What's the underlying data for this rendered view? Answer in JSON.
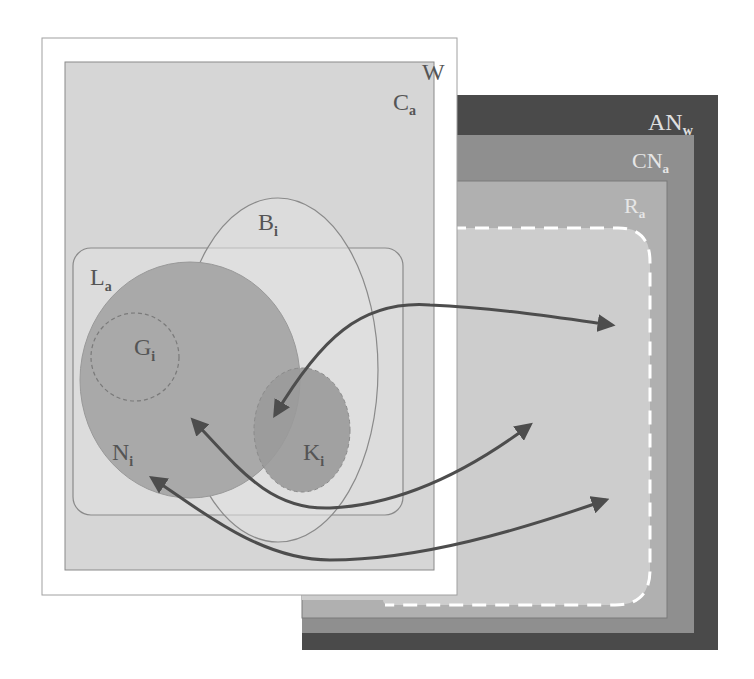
{
  "diagram": {
    "type": "nested-set-diagram",
    "colors": {
      "background": "#ffffff",
      "an_w_fill": "#4a4a4a",
      "cn_a_fill": "#8f8f8f",
      "r_a_fill": "#b0b0b0",
      "dashed_region_fill": "#cdcdcd",
      "dashed_region_stroke": "#ffffff",
      "w_fill": "#ffffff",
      "c_a_fill": "#d6d6d6",
      "l_a_fill": "#dcdcdc",
      "b_i_fill": "#e0e0e0",
      "n_i_fill": "#a9a9a9",
      "k_i_fill": "#9a9a9a",
      "arrow": "#4d4d4d",
      "outline": "#8a8a8a",
      "light_label": "#e6e6e6",
      "dark_label": "#555555"
    },
    "labels": {
      "w": {
        "main": "W",
        "sub": ""
      },
      "c_a": {
        "main": "C",
        "sub": "a"
      },
      "an_w": {
        "main": "AN",
        "sub": "w"
      },
      "cn_a": {
        "main": "CN",
        "sub": "a"
      },
      "r_a": {
        "main": "R",
        "sub": "a"
      },
      "b_i": {
        "main": "B",
        "sub": "i"
      },
      "l_a": {
        "main": "L",
        "sub": "a"
      },
      "g_i": {
        "main": "G",
        "sub": "i"
      },
      "n_i": {
        "main": "N",
        "sub": "i"
      },
      "k_i": {
        "main": "K",
        "sub": "i"
      }
    },
    "arrows": [
      {
        "from": "K_i",
        "to": "dashed-region",
        "direction": "bidirectional"
      },
      {
        "from": "N_i (center)",
        "to": "dashed-region",
        "direction": "bidirectional"
      },
      {
        "from": "N_i (lower)",
        "to": "dashed-region",
        "direction": "bidirectional"
      }
    ]
  }
}
